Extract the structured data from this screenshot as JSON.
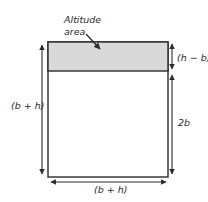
{
  "diagram": {
    "callout": {
      "line1": "Altitude",
      "line2": "area"
    },
    "labels": {
      "top_right": "(h − b)",
      "right": "2b",
      "left": "(b + h)",
      "bottom": "(b + h)"
    },
    "colors": {
      "stroke": "#2b2b2b",
      "shaded_fill": "#d9d9d9",
      "background": "#ffffff"
    }
  }
}
